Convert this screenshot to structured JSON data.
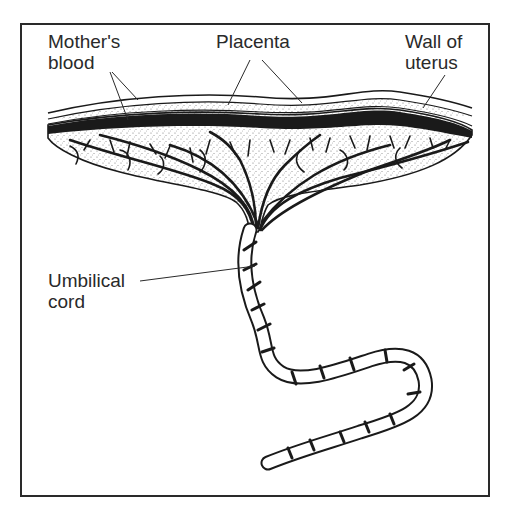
{
  "diagram": {
    "labels": {
      "mothers_blood": [
        "Mother's",
        "blood"
      ],
      "placenta": "Placenta",
      "wall_of_uterus": [
        "Wall of",
        "uterus"
      ],
      "umbilical_cord": [
        "Umbilical",
        "cord"
      ]
    },
    "colors": {
      "ink": "#1a1a1a",
      "background": "#ffffff",
      "stipple": "#7a7a7a"
    }
  }
}
